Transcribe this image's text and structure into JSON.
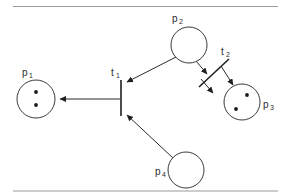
{
  "figure": {
    "background_color": "#ffffff",
    "line_color": "#2b2b2b",
    "token_color": "#1a1a1a",
    "rule_color": "#9a9a9a",
    "width": 289,
    "height": 196
  },
  "rules": {
    "top_label": "top-horizontal-rule",
    "bottom_label": "bottom-horizontal-rule"
  },
  "places": [
    {
      "id": "p1",
      "base": "p",
      "subscript": "1",
      "label": "p1",
      "cx": 36,
      "cy": 99,
      "r": 19,
      "tokens": 2,
      "token_positions": [
        [
          36,
          92
        ],
        [
          36,
          105
        ]
      ],
      "label_x": 22,
      "label_y": 73
    },
    {
      "id": "p2",
      "base": "p",
      "subscript": "2",
      "label": "p2",
      "cx": 189,
      "cy": 45,
      "r": 18,
      "tokens": 0,
      "token_positions": [],
      "label_x": 172,
      "label_y": 20
    },
    {
      "id": "p3",
      "base": "p",
      "subscript": "3",
      "label": "p3",
      "cx": 242,
      "cy": 102,
      "r": 18,
      "tokens": 2,
      "token_positions": [
        [
          247,
          95
        ],
        [
          236,
          109
        ]
      ],
      "label_x": 264,
      "label_y": 106
    },
    {
      "id": "p4",
      "base": "p",
      "subscript": "4",
      "label": "p4",
      "cx": 186,
      "cy": 170,
      "r": 18,
      "tokens": 0,
      "token_positions": [],
      "label_x": 155,
      "label_y": 172
    }
  ],
  "transitions": [
    {
      "id": "t1",
      "base": "t",
      "subscript": "1",
      "label": "t1",
      "orientation": "vertical",
      "x1": 121,
      "y1": 80,
      "x2": 121,
      "y2": 116,
      "label_x": 110,
      "label_y": 74
    },
    {
      "id": "t2",
      "base": "t",
      "subscript": "2",
      "label": "t2",
      "orientation": "diagonal",
      "x1": 201,
      "y1": 84,
      "x2": 228,
      "y2": 60,
      "label_x": 222,
      "label_y": 53
    }
  ],
  "arcs": [
    {
      "id": "t1-to-p1",
      "from": "t1",
      "to": "p1",
      "x1": 120,
      "y1": 99,
      "x2": 57,
      "y2": 99
    },
    {
      "id": "p2-to-t1",
      "from": "p2",
      "to": "t1",
      "x1": 176,
      "y1": 57,
      "x2": 125,
      "y2": 83
    },
    {
      "id": "p4-to-t1",
      "from": "p4",
      "to": "t1",
      "x1": 173,
      "y1": 158,
      "x2": 125,
      "y2": 114
    },
    {
      "id": "p2-to-t2",
      "from": "p2",
      "to": "t2",
      "x1": 199,
      "y1": 60,
      "x2": 210,
      "y2": 75
    },
    {
      "id": "t2-to-p3",
      "from": "t2",
      "to": "p3",
      "x1": 221,
      "y1": 70,
      "x2": 234,
      "y2": 88
    },
    {
      "id": "p3-to-t2",
      "from": "p3",
      "to": "t2",
      "x1": 222,
      "y1": 88,
      "x2": 210,
      "y2": 75
    },
    {
      "id": "t2-to-p3-lower",
      "from": "t2",
      "to": "p3",
      "x1": 208,
      "y1": 81,
      "x2": 227,
      "y2": 92
    }
  ],
  "icons": {
    "token": "token-dot",
    "place": "place-circle",
    "transition": "transition-bar",
    "arrow": "arrow-head"
  }
}
